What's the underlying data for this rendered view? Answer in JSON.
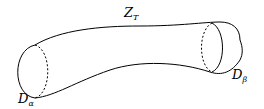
{
  "diagram": {
    "type": "tube-cobordism",
    "colors": {
      "stroke": "#000000",
      "background": "#ffffff"
    },
    "labels": {
      "tube": {
        "main": "Z",
        "sub": "T"
      },
      "left_disk": {
        "main": "D",
        "sub": "α"
      },
      "right_disk": {
        "main": "D",
        "sub": "β"
      }
    },
    "elements": [
      {
        "id": "tube",
        "desc": "curved tube surface"
      },
      {
        "id": "left-disk",
        "desc": "left end cap with solid front arc and dashed back arc"
      },
      {
        "id": "right-disk",
        "desc": "right end cap with solid front arc and dashed back arc"
      }
    ]
  }
}
